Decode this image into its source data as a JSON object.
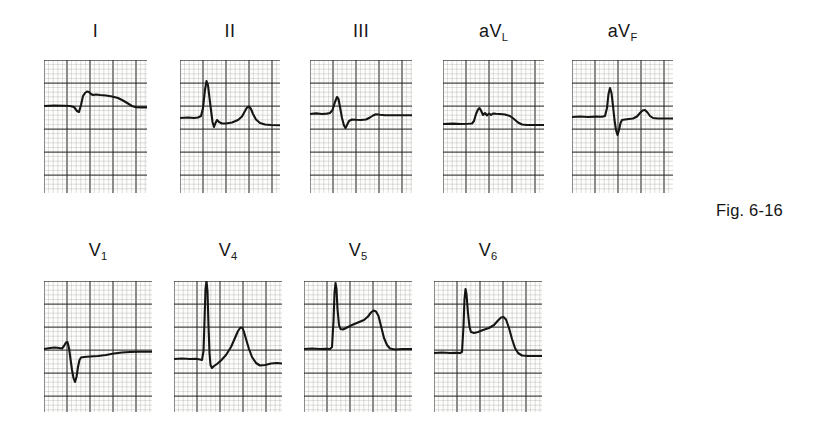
{
  "figure": {
    "caption": "Fig. 6-16",
    "caption_x": 716,
    "caption_y": 201,
    "background": "#ffffff",
    "trace_color": "#151515",
    "grid_fine_color": "#8d8d8d",
    "grid_bold_color": "#2a2a2a",
    "paper_color": "#fdfdfb"
  },
  "grid": {
    "fine_spacing_px": 4.6,
    "bold_every": 5,
    "fine_line_width": 0.55,
    "bold_line_width": 1.25
  },
  "rows": [
    {
      "name": "limb-leads",
      "label_y": 22,
      "strip_y": 60,
      "strip_height": 133
    },
    {
      "name": "precordial-leads",
      "label_y": 241,
      "strip_y": 281,
      "strip_height": 131
    }
  ],
  "leads": [
    {
      "id": "I",
      "row": 0,
      "label_main": "I",
      "label_sub": "",
      "x": 44,
      "y": 60,
      "width": 103,
      "height": 133,
      "baseline": 46,
      "trace": "M0,46 L10,45.5 L20,45.8 L26,46 L30,47 L33,51 L35,52 L37,45 L39,36 L41,33 L43,31.5 L45,32 L47,34 L49,35 L52,34.5 L56,35 L62,35.5 L68,36.5 L74,38 L79,40.5 L84,43.5 L88,46 L92,47.2 L97,47.4 L103,47.4"
    },
    {
      "id": "II",
      "row": 0,
      "label_main": "II",
      "label_sub": "",
      "x": 180,
      "y": 60,
      "width": 100,
      "height": 133,
      "baseline": 58,
      "trace": "M0,58 L8,57.5 L14,58 L18,57.5 L21,56 L23,48 L25,30 L26.5,21 L28,25 L29.5,38 L31,50 L32.5,62 L34,67 L35.5,63 L37,60 L39,62 L42,63.5 L46,63.5 L52,62.5 L58,60 L62,56.5 L65,51 L67,47.5 L69,46.5 L71,49 L73,54 L76,59.5 L80,63 L85,64.5 L91,65 L100,65.2"
    },
    {
      "id": "III",
      "row": 0,
      "label_main": "III",
      "label_sub": "",
      "x": 310,
      "y": 60,
      "width": 102,
      "height": 133,
      "baseline": 54,
      "trace": "M0,54 L6,53.4 L12,54 L17,53.6 L20,53 L22.5,50 L25,42 L27,37 L28.5,39 L30,47 L32,58 L34,65.5 L35.5,68 L37,65 L39,61 L42,59.5 L46,59.8 L51,60 L56,59.5 L60,57.5 L63,55.5 L66,54.2 L70,54.8 L75,55.2 L82,55.2 L90,55.2 L102,55.2"
    },
    {
      "id": "aVL",
      "row": 0,
      "label_main": "aV",
      "label_sub": "L",
      "x": 443,
      "y": 60,
      "width": 101,
      "height": 133,
      "baseline": 64,
      "trace": "M0,64 L10,63.6 L18,64 L25,63.8 L29,63.5 L31,61 L33,54 L35,49.5 L36.5,48 L38,50.5 L40,55 L42,53 L44,55.5 L46,53.5 L48,55 L50,53.5 L53,53.8 L57,54 L62,54.5 L67,56 L71,59 L75,62.5 L79,64.5 L84,65 L92,65 L101,65"
    },
    {
      "id": "aVF",
      "row": 0,
      "label_main": "aV",
      "label_sub": "F",
      "x": 572,
      "y": 60,
      "width": 101,
      "height": 133,
      "baseline": 57,
      "trace": "M0,57 L8,56.5 L16,57 L24,56.6 L30,56.8 L33,56 L35,48 L36.5,34 L38,28 L39.5,33 L41,46 L42.5,60 L44,70 L45.5,75 L47,70 L48.5,63 L50,60 L53,59.5 L57,59 L61,58.5 L65,56.5 L68,53 L70.5,50.5 L73,50 L75.5,52.5 L78,56 L81,58 L86,58.5 L93,58.5 L101,58.5"
    },
    {
      "id": "V1",
      "row": 1,
      "label_main": "V",
      "label_sub": "1",
      "x": 44,
      "y": 281,
      "width": 108,
      "height": 131,
      "baseline": 68,
      "trace": "M0,68 L6,67 L11,66.5 L15,67 L18,67.5 L20,65 L22,61.5 L23.5,61 L25,67 L26.5,78 L28,89 L29.5,97 L31,101 L32.5,96 L34,86 L35.5,79 L37,76.5 L40,76 L46,75.5 L54,75 L62,74 L70,72.5 L78,71.5 L86,71 L96,70.8 L108,70.8"
    },
    {
      "id": "V4",
      "row": 1,
      "label_main": "V",
      "label_sub": "4",
      "x": 174,
      "y": 281,
      "width": 108,
      "height": 131,
      "baseline": 78,
      "trace": "M0,78 L8,77.5 L16,78 L22,77.8 L26,78.5 L28,79 L29.5,70 L30.5,40 L31.5,8 L32.5,0 L33.5,10 L34.5,45 L35.5,72 L36.5,84 L38,87 L40,85 L43,83 L47,79.5 L52,74 L57,66 L61,57 L64,50 L66.5,46.5 L68.5,47 L70,51 L72,58 L75,68 L78,76 L82,82 L86,84.5 L91,84 L97,82.5 L103,82 L108,82.5"
    },
    {
      "id": "V5",
      "row": 1,
      "label_main": "V",
      "label_sub": "5",
      "x": 304,
      "y": 281,
      "width": 108,
      "height": 131,
      "baseline": 68,
      "trace": "M0,68 L8,67.5 L16,68 L22,67.8 L26,68 L28,66 L29.5,40 L30.5,12 L31.5,2 L32.5,8 L33.5,28 L35,44 L36.5,48 L39,48.5 L43,46.5 L48,44 L54,41.5 L60,39 L64,35.5 L67,31.5 L69.5,29.5 L72,30.5 L74.5,35 L77,45 L80,57 L83,64 L86,67.5 L91,68.5 L98,68 L104,68 L108,68"
    },
    {
      "id": "V6",
      "row": 1,
      "label_main": "V",
      "label_sub": "6",
      "x": 434,
      "y": 281,
      "width": 108,
      "height": 131,
      "baseline": 72,
      "trace": "M0,72 L8,71.5 L16,72 L22,71.8 L26,72 L28,71 L29.5,45 L30.5,18 L31.5,8 L32.5,13 L34,32 L35.5,46 L37,51 L40,52 L44,51 L49,49 L55,47 L60,44 L64,39.5 L67,36.5 L69.5,36 L72,38.5 L75,47 L78,58 L81,67 L84,72 L88,74.5 L94,75 L101,75 L108,75"
    }
  ]
}
